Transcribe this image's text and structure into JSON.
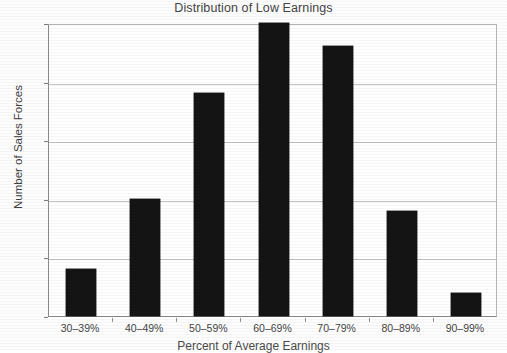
{
  "chart_data": {
    "type": "bar",
    "title": "Distribution of Low Earnings",
    "xlabel": "Percent of Average Earnings",
    "ylabel": "Number of Sales Forces",
    "categories": [
      "30–39%",
      "40–49%",
      "50–59%",
      "60–69%",
      "70–79%",
      "80–89%",
      "90–99%"
    ],
    "values": [
      4,
      10,
      19,
      25,
      23,
      9,
      2
    ],
    "ylim": [
      0,
      25
    ],
    "yticks": [
      0,
      5,
      10,
      15,
      20,
      25
    ],
    "ytick_labels": [
      "0",
      "5",
      "10",
      "15",
      "20",
      "25"
    ],
    "grid": true,
    "legend": "none",
    "bar_color": "#141414",
    "background_color": "#fdfdfd",
    "gridline_color": "#c2c2c2",
    "axis_color": "#8a8a8a"
  }
}
